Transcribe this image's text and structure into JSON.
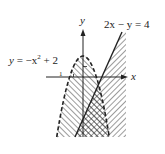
{
  "diagram": {
    "type": "system-of-inequalities-graph",
    "axes": {
      "x_label": "x",
      "y_label": "y",
      "tick_label": "1"
    },
    "curves": [
      {
        "name": "parabola",
        "equation_label": "y = −x² + 2",
        "style": "dashed"
      },
      {
        "name": "line",
        "equation_label": "2x − y = 4",
        "style": "solid"
      }
    ],
    "label_parabola": {
      "y": "y",
      "eq": "= −x",
      "sup": "2",
      "rest": "+ 2"
    },
    "label_line": {
      "lhs": "2x − y = 4"
    },
    "colors": {
      "ink": "#222222",
      "background": "#ffffff"
    }
  }
}
